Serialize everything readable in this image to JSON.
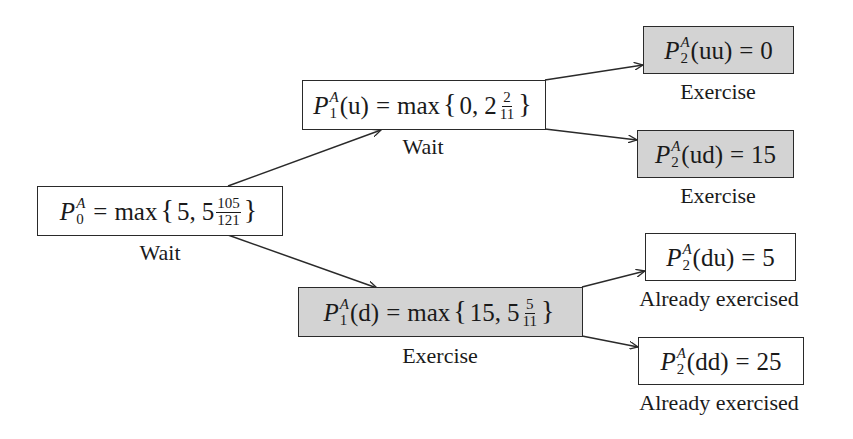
{
  "diagram": {
    "type": "binomial-tree",
    "colors": {
      "exercise_fill": "#d3d3d3",
      "wait_fill": "#ffffff",
      "border": "#2a2a2a"
    },
    "nodes": {
      "p0": {
        "var": "P",
        "sub": "0",
        "sup": "A",
        "arg": "",
        "rhs_prefix": "max",
        "values": [
          "5",
          "5"
        ],
        "frac": {
          "num": "105",
          "den": "121"
        },
        "decision": "Wait",
        "filled": false
      },
      "p1u": {
        "var": "P",
        "sub": "1",
        "sup": "A",
        "arg": "(u)",
        "rhs_prefix": "max",
        "values": [
          "0",
          "2"
        ],
        "frac": {
          "num": "2",
          "den": "11"
        },
        "decision": "Wait",
        "filled": false
      },
      "p1d": {
        "var": "P",
        "sub": "1",
        "sup": "A",
        "arg": "(d)",
        "rhs_prefix": "max",
        "values": [
          "15",
          "5"
        ],
        "frac": {
          "num": "5",
          "den": "11"
        },
        "decision": "Exercise",
        "filled": true
      },
      "p2uu": {
        "var": "P",
        "sub": "2",
        "sup": "A",
        "arg": "(uu)",
        "value": "0",
        "decision": "Exercise",
        "filled": true
      },
      "p2ud": {
        "var": "P",
        "sub": "2",
        "sup": "A",
        "arg": "(ud)",
        "value": "15",
        "decision": "Exercise",
        "filled": true
      },
      "p2du": {
        "var": "P",
        "sub": "2",
        "sup": "A",
        "arg": "(du)",
        "value": "5",
        "decision": "Already exercised",
        "filled": false
      },
      "p2dd": {
        "var": "P",
        "sub": "2",
        "sup": "A",
        "arg": "(dd)",
        "value": "25",
        "decision": "Already exercised",
        "filled": false
      }
    },
    "edges": [
      {
        "from": "p0",
        "to": "p1u"
      },
      {
        "from": "p0",
        "to": "p1d"
      },
      {
        "from": "p1u",
        "to": "p2uu"
      },
      {
        "from": "p1u",
        "to": "p2ud"
      },
      {
        "from": "p1d",
        "to": "p2du"
      },
      {
        "from": "p1d",
        "to": "p2dd"
      }
    ],
    "symbols": {
      "equals": "=",
      "comma": ",",
      "lbrace": "{",
      "rbrace": "}"
    }
  }
}
